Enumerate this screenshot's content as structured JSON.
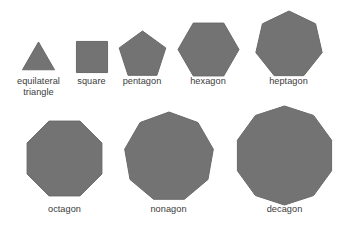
{
  "figure": {
    "background_color": "#ffffff",
    "shape_fill_color": "#737373",
    "shape_stroke_color": "#6a6a6a",
    "label_color": "#3b3b3b",
    "width": 351,
    "height": 231
  },
  "chart_data": {
    "type": "diagram",
    "title": "",
    "xlabel": "",
    "ylabel": "",
    "categories": [
      "equilateral\ntriangle",
      "square",
      "pentagon",
      "hexagon",
      "heptagon",
      "octagon",
      "nonagon",
      "decagon"
    ],
    "values": [
      3,
      4,
      5,
      6,
      7,
      8,
      9,
      10
    ],
    "rows": [
      {
        "row_index": 0,
        "baseline_y": 72,
        "items": [
          {
            "name": "equilateral triangle",
            "label": "equilateral\ntriangle",
            "sides": 3,
            "cx": 38.5,
            "cy": 60.5,
            "radius": 18.5,
            "rotation": -90,
            "label_x": 2,
            "label_y": 76,
            "label_width": 73
          },
          {
            "name": "square",
            "label": "square",
            "sides": 4,
            "cx": 91.5,
            "cy": 56.5,
            "radius": 22.0,
            "rotation": -45,
            "label_x": 62,
            "label_y": 76,
            "label_width": 59
          },
          {
            "name": "pentagon",
            "label": "pentagon",
            "sides": 5,
            "cx": 142.0,
            "cy": 55.0,
            "radius": 24.5,
            "rotation": -90,
            "label_x": 110,
            "label_y": 76,
            "label_width": 64
          },
          {
            "name": "hexagon",
            "label": "hexagon",
            "sides": 6,
            "cx": 208.0,
            "cy": 49.0,
            "radius": 30.5,
            "rotation": 0,
            "label_x": 176,
            "label_y": 76,
            "label_width": 64
          },
          {
            "name": "heptagon",
            "label": "heptagon",
            "sides": 7,
            "cx": 288.5,
            "cy": 44.5,
            "radius": 34.0,
            "rotation": -90,
            "label_x": 255,
            "label_y": 76,
            "label_width": 67
          }
        ]
      },
      {
        "row_index": 1,
        "baseline_y": 200,
        "items": [
          {
            "name": "octagon",
            "label": "octagon",
            "sides": 8,
            "cx": 64.5,
            "cy": 158.5,
            "radius": 40.5,
            "rotation": 22.5,
            "label_x": 32,
            "label_y": 204,
            "label_width": 65
          },
          {
            "name": "nonagon",
            "label": "nonagon",
            "sides": 9,
            "cx": 168.5,
            "cy": 157.0,
            "radius": 45.0,
            "rotation": -90,
            "label_x": 136,
            "label_y": 204,
            "label_width": 65
          },
          {
            "name": "decagon",
            "label": "decagon",
            "sides": 10,
            "cx": 284.5,
            "cy": 155.5,
            "radius": 49.5,
            "rotation": -90,
            "label_x": 252,
            "label_y": 204,
            "label_width": 65
          }
        ]
      }
    ]
  }
}
